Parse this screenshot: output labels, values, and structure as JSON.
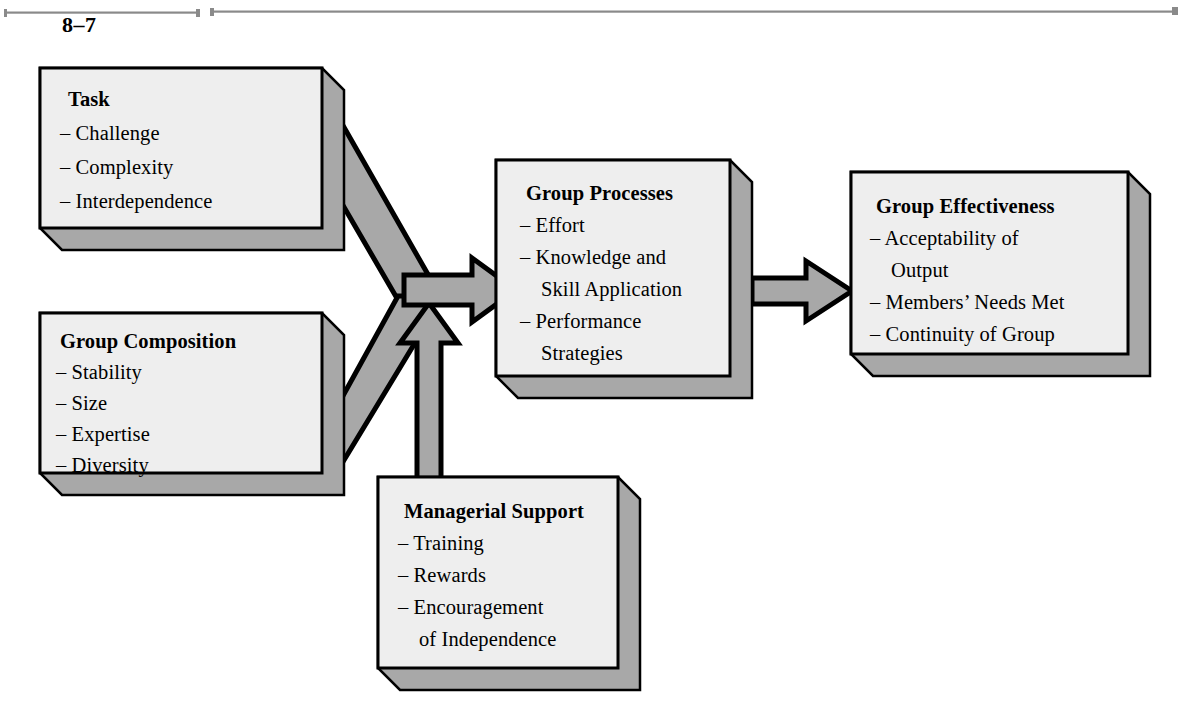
{
  "page": {
    "figure_number": "8–7",
    "background_color": "#ffffff",
    "rule_color": "#7d7d7d"
  },
  "style": {
    "box_fill": "#eeeeee",
    "box_stroke": "#000000",
    "shadow_fill": "#a8a8a8",
    "arrow_fill": "#a8a8a8",
    "arrow_stroke": "#000000",
    "text_color": "#000000"
  },
  "boxes": [
    {
      "id": "task",
      "title": "Task",
      "items": [
        "– Challenge",
        "– Complexity",
        "– Interdependence"
      ]
    },
    {
      "id": "group-composition",
      "title": "Group Composition",
      "items": [
        "– Stability",
        "– Size",
        "– Expertise",
        "– Diversity"
      ]
    },
    {
      "id": "group-processes",
      "title": "Group Processes",
      "items": [
        "– Effort",
        "– Knowledge and",
        "Skill Application",
        "– Performance",
        "Strategies"
      ]
    },
    {
      "id": "group-effectiveness",
      "title": "Group Effectiveness",
      "items": [
        "– Acceptability of",
        "Output",
        "– Members’ Needs Met",
        "– Continuity of Group"
      ]
    },
    {
      "id": "managerial-support",
      "title": "Managerial Support",
      "items": [
        "– Training",
        "– Rewards",
        "– Encouragement",
        "of Independence"
      ]
    }
  ],
  "arrows": [
    {
      "id": "task-to-junction",
      "from": "task",
      "to": "group-processes",
      "direction": "diagonal-down-right"
    },
    {
      "id": "composition-to-junction",
      "from": "group-composition",
      "to": "group-processes",
      "direction": "diagonal-up-right"
    },
    {
      "id": "managerial-to-junction",
      "from": "managerial-support",
      "to": "group-processes",
      "direction": "up"
    },
    {
      "id": "junction-to-processes",
      "from": "junction",
      "to": "group-processes",
      "direction": "right"
    },
    {
      "id": "processes-to-effectiveness",
      "from": "group-processes",
      "to": "group-effectiveness",
      "direction": "right"
    }
  ]
}
